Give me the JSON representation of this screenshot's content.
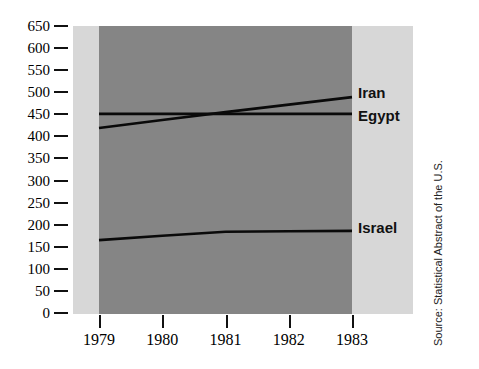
{
  "chart_data": {
    "type": "line",
    "title": "",
    "xlabel": "",
    "ylabel": "",
    "x": [
      1979,
      1980,
      1981,
      1982,
      1983
    ],
    "xticklabels": [
      "1979",
      "1980",
      "1981",
      "1982",
      "1983"
    ],
    "xlim": [
      1979,
      1983
    ],
    "ylim": [
      0,
      650
    ],
    "yticks": [
      0,
      50,
      100,
      150,
      200,
      250,
      300,
      350,
      400,
      450,
      500,
      550,
      600,
      650
    ],
    "yticklabels": [
      "0",
      "50",
      "100",
      "150",
      "200",
      "250",
      "300",
      "350",
      "400",
      "450",
      "500",
      "550",
      "600",
      "650"
    ],
    "grid": false,
    "legend_position": "right-inline",
    "series": [
      {
        "name": "Iran",
        "values": [
          419,
          437,
          455,
          472,
          489
        ],
        "color": "#0a0a0a"
      },
      {
        "name": "Egypt",
        "values": [
          451,
          451,
          451,
          451,
          451
        ],
        "color": "#0a0a0a"
      },
      {
        "name": "Israel",
        "values": [
          165,
          175,
          184,
          185,
          186
        ],
        "color": "#0a0a0a"
      }
    ],
    "annotations": [
      "Source: Statistical Abstract of the U.S."
    ],
    "plot_bg_color": "#d7d7d7",
    "data_fill_color": "#858585"
  },
  "axis": {
    "y_ticks": [
      {
        "label": "650",
        "value": 650
      },
      {
        "label": "600",
        "value": 600
      },
      {
        "label": "550",
        "value": 550
      },
      {
        "label": "500",
        "value": 500
      },
      {
        "label": "450",
        "value": 450
      },
      {
        "label": "400",
        "value": 400
      },
      {
        "label": "350",
        "value": 350
      },
      {
        "label": "300",
        "value": 300
      },
      {
        "label": "250",
        "value": 250
      },
      {
        "label": "200",
        "value": 200
      },
      {
        "label": "150",
        "value": 150
      },
      {
        "label": "100",
        "value": 100
      },
      {
        "label": "50",
        "value": 50
      },
      {
        "label": "0",
        "value": 0
      }
    ],
    "x_ticks": [
      {
        "label": "1979",
        "value": 1979
      },
      {
        "label": "1980",
        "value": 1980
      },
      {
        "label": "1981",
        "value": 1981
      },
      {
        "label": "1982",
        "value": 1982
      },
      {
        "label": "1983",
        "value": 1983
      }
    ]
  },
  "series_labels": [
    {
      "name": "Iran",
      "text": "Iran"
    },
    {
      "name": "Egypt",
      "text": "Egypt"
    },
    {
      "name": "Israel",
      "text": "Israel"
    }
  ],
  "source": {
    "text": "Source: Statistical Abstract of the U.S."
  }
}
